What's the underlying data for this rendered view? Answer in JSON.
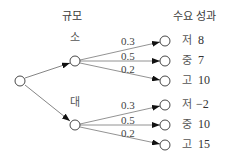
{
  "headers": {
    "size": "규모",
    "outcome": "수요 성과"
  },
  "root": {
    "id": "decision"
  },
  "branches": [
    {
      "label": "소",
      "outcomes": [
        {
          "prob": "0.3",
          "demand": "저",
          "value": "8"
        },
        {
          "prob": "0.5",
          "demand": "중",
          "value": "7"
        },
        {
          "prob": "0.2",
          "demand": "고",
          "value": "10"
        }
      ]
    },
    {
      "label": "대",
      "outcomes": [
        {
          "prob": "0.3",
          "demand": "저",
          "value": "−2"
        },
        {
          "prob": "0.5",
          "demand": "중",
          "value": "10"
        },
        {
          "prob": "0.2",
          "demand": "고",
          "value": "15"
        }
      ]
    }
  ],
  "colors": {
    "line": "#555555",
    "node_stroke": "#333333",
    "arrow": "#111111"
  }
}
